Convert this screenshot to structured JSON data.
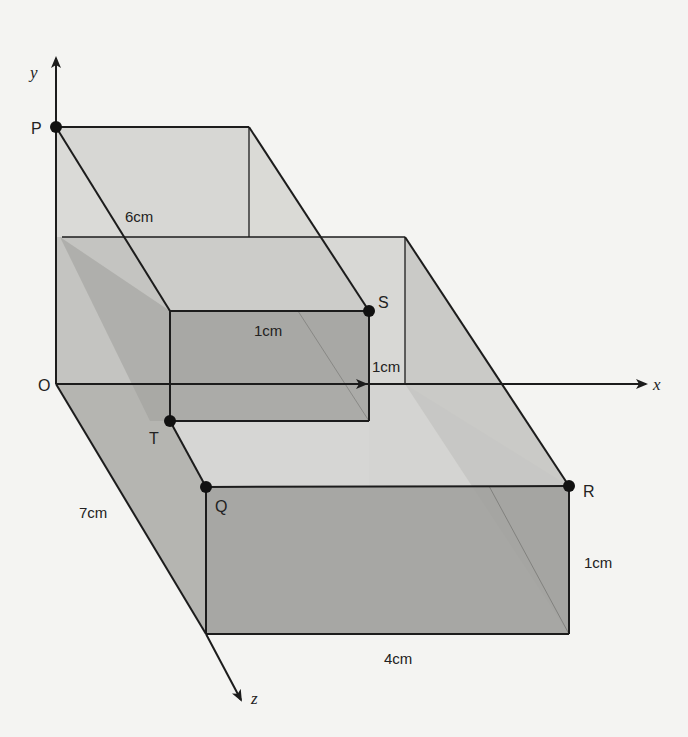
{
  "diagram": {
    "type": "3d-prism-diagram",
    "axes": {
      "x": "x",
      "y": "y",
      "z": "z",
      "origin": "O"
    },
    "points": {
      "P": "P",
      "S": "S",
      "T": "T",
      "Q": "Q",
      "R": "R"
    },
    "dimensions": {
      "top_depth": "6cm",
      "step_width": "1cm",
      "step_height": "1cm",
      "base_depth": "7cm",
      "front_height": "1cm",
      "front_width": "4cm"
    },
    "colors": {
      "background": "#f4f4f2",
      "line": "#1c1c1c",
      "face_light": "#dcdcd9",
      "face_mid": "#b9b9b6",
      "face_dark": "#999996",
      "point": "#111111"
    }
  }
}
